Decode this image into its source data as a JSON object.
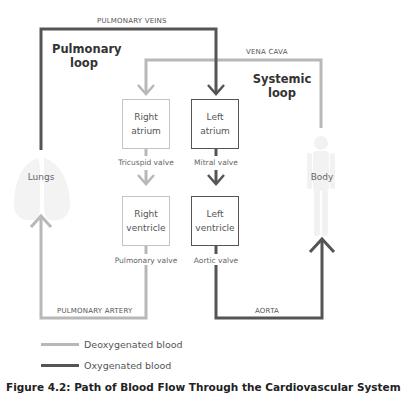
{
  "colors": {
    "deoxygenated": "#b8b8b8",
    "oxygenated": "#555555"
  },
  "vessels": {
    "pulmonary_veins": "PULMONARY VEINS",
    "vena_cava": "VENA CAVA",
    "pulmonary_artery": "PULMONARY ARTERY",
    "aorta": "AORTA"
  },
  "loops": {
    "pulmonary": {
      "line1": "Pulmonary",
      "line2": "loop"
    },
    "systemic": {
      "line1": "Systemic",
      "line2": "loop"
    }
  },
  "chambers": {
    "right_atrium": {
      "line1": "Right",
      "line2": "atrium"
    },
    "left_atrium": {
      "line1": "Left",
      "line2": "atrium"
    },
    "right_ventricle": {
      "line1": "Right",
      "line2": "ventricle"
    },
    "left_ventricle": {
      "line1": "Left",
      "line2": "ventricle"
    }
  },
  "valves": {
    "tricuspid": "Tricuspid valve",
    "mitral": "Mitral valve",
    "pulmonary": "Pulmonary valve",
    "aortic": "Aortic valve"
  },
  "organs": {
    "lungs": "Lungs",
    "body": "Body"
  },
  "legend": [
    {
      "label": "Deoxygenated blood",
      "type": "deoxygenated"
    },
    {
      "label": "Oxygenated blood",
      "type": "oxygenated"
    }
  ],
  "caption": "Figure 4.2: Path of Blood Flow Through the Cardiovascular System"
}
